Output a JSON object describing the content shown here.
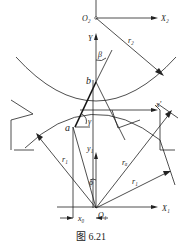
{
  "figure": {
    "caption": "图 6.21",
    "labels": {
      "O2": "O₂",
      "X2": "X₂",
      "r2": "r₂",
      "Y": "Y",
      "beta": "β",
      "b": "b",
      "a": "a",
      "gamma": "γ",
      "x1_prime": "x'",
      "y1": "y₁",
      "r1_left": "r₁",
      "ra": "rₐ",
      "phi": "ϕ",
      "r1_right": "r₁",
      "O1": "O₁",
      "X1": "X₁",
      "x0": "x₀"
    }
  }
}
